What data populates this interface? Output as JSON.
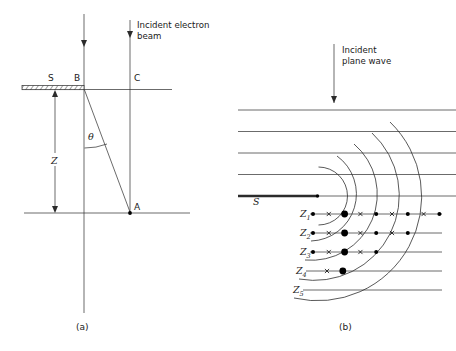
{
  "figure": {
    "panels": [
      {
        "id": "a",
        "caption": "(a)",
        "annotation": {
          "line1": "Incident electron",
          "line2": "beam"
        },
        "labels": {
          "screen_s": "S",
          "point_b": "B",
          "point_c": "C",
          "point_a": "A",
          "distance_z": "Z",
          "angle_theta": "θ"
        }
      },
      {
        "id": "b",
        "caption": "(b)",
        "annotation": {
          "line1": "Incident",
          "line2": "plane wave"
        },
        "labels": {
          "slit_s": "S",
          "zones": [
            {
              "base": "Z",
              "sub": "1"
            },
            {
              "base": "Z",
              "sub": "2"
            },
            {
              "base": "Z",
              "sub": "3"
            },
            {
              "base": "Z",
              "sub": "4"
            },
            {
              "base": "Z",
              "sub": "5"
            }
          ]
        },
        "zone_rows": [
          {
            "zone": "Z1",
            "y": 214,
            "markers": [
              "dot",
              "x",
              "bigdot",
              "x",
              "dot",
              "x",
              "dot",
              "x",
              "dot"
            ]
          },
          {
            "zone": "Z2",
            "y": 233,
            "markers": [
              "dot",
              "x",
              "bigdot",
              "x",
              "dot",
              "x",
              "dot"
            ]
          },
          {
            "zone": "Z3",
            "y": 252,
            "markers": [
              "dot",
              "x",
              "bigdot",
              "x",
              "dot"
            ]
          },
          {
            "zone": "Z4",
            "y": 271,
            "markers": [
              "x",
              "bigdot"
            ]
          },
          {
            "zone": "Z5",
            "y": 290,
            "markers": []
          }
        ],
        "plane_wave_lines": 5,
        "wavefront_arcs": 5
      }
    ],
    "colors": {
      "ink": "#2b2b2b",
      "marker": "#000000",
      "background": "#ffffff"
    }
  }
}
